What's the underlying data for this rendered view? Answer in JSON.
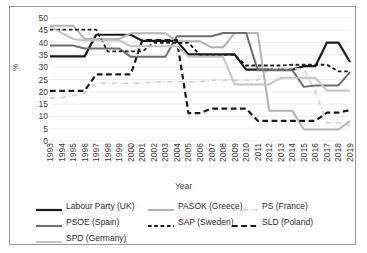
{
  "axes": {
    "ylabel": "%",
    "xlabel": "Year",
    "y_ticks": [
      "0",
      "5",
      "10",
      "15",
      "20",
      "25",
      "30",
      "35",
      "40",
      "45",
      "50"
    ]
  },
  "legend": {
    "rows": [
      [
        {
          "key": "labour_uk",
          "label": "Labour Party (UK)"
        },
        {
          "key": "pasok_greece",
          "label": "PASOK (Greece)"
        },
        {
          "key": "ps_france",
          "label": "PS (France)"
        }
      ],
      [
        {
          "key": "psoe_spain",
          "label": "PSOE (Spain)"
        },
        {
          "key": "sap_sweden",
          "label": "SAP (Sweden)"
        },
        {
          "key": "sld_poland",
          "label": "SLD (Poland)"
        }
      ],
      [
        {
          "key": "spd_germany",
          "label": "SPD (Germany)"
        }
      ]
    ]
  },
  "chart_data": {
    "type": "line",
    "title": "",
    "xlabel": "Year",
    "ylabel": "%",
    "ylim": [
      0,
      50
    ],
    "ytick_step": 5,
    "grid": true,
    "legend_position": "bottom",
    "x": [
      1993,
      1994,
      1995,
      1996,
      1997,
      1998,
      1999,
      2000,
      2001,
      2002,
      2003,
      2004,
      2005,
      2006,
      2007,
      2008,
      2009,
      2010,
      2011,
      2012,
      2013,
      2014,
      2015,
      2016,
      2017,
      2018,
      2019
    ],
    "categories": [
      "1993",
      "1994",
      "1995",
      "1996",
      "1997",
      "1998",
      "1999",
      "2000",
      "2001",
      "2002",
      "2003",
      "2004",
      "2005",
      "2006",
      "2007",
      "2008",
      "2009",
      "2010",
      "2011",
      "2012",
      "2013",
      "2014",
      "2015",
      "2016",
      "2017",
      "2018",
      "2019"
    ],
    "series": [
      {
        "name": "Labour Party (UK)",
        "key": "labour_uk",
        "color": "#1a1a1a",
        "style": "solid",
        "width": 2.2,
        "values": [
          34.4,
          34.4,
          34.4,
          34.4,
          43.2,
          43.2,
          43.2,
          43.2,
          40.7,
          40.7,
          40.7,
          40.7,
          35.2,
          35.2,
          35.2,
          35.2,
          35.2,
          29.0,
          29.0,
          29.0,
          29.0,
          29.0,
          30.4,
          30.4,
          40.0,
          40.0,
          32.1
        ]
      },
      {
        "name": "PASOK (Greece)",
        "key": "pasok_greece",
        "color": "#b3b3b3",
        "style": "solid",
        "width": 2.0,
        "values": [
          46.9,
          46.9,
          46.9,
          41.5,
          41.5,
          41.5,
          41.5,
          43.8,
          43.8,
          43.8,
          43.8,
          40.5,
          40.5,
          40.5,
          38.1,
          38.1,
          43.9,
          43.9,
          43.9,
          12.3,
          12.3,
          12.3,
          4.7,
          4.7,
          4.7,
          4.7,
          8.1
        ]
      },
      {
        "name": "PS (France)",
        "key": "ps_france",
        "color": "#cfcfcf",
        "style": "dashdot",
        "width": 1.6,
        "values": [
          17.6,
          17.6,
          18.5,
          19.5,
          23.5,
          23.5,
          23.5,
          23.5,
          23.5,
          24.1,
          24.1,
          24.1,
          24.1,
          24.1,
          24.7,
          24.7,
          24.7,
          24.7,
          24.7,
          29.4,
          29.4,
          29.4,
          29.4,
          20.0,
          7.4,
          7.4,
          6.2
        ]
      },
      {
        "name": "PSOE (Spain)",
        "key": "psoe_spain",
        "color": "#6e6e6e",
        "style": "solid",
        "width": 2.0,
        "values": [
          38.8,
          38.8,
          38.8,
          37.6,
          37.6,
          37.6,
          37.6,
          34.2,
          34.2,
          34.2,
          34.2,
          42.6,
          42.6,
          42.6,
          42.6,
          43.9,
          43.9,
          43.9,
          28.8,
          28.8,
          28.8,
          28.8,
          22.0,
          22.6,
          22.6,
          22.6,
          28.0
        ]
      },
      {
        "name": "SAP (Sweden)",
        "key": "sap_sweden",
        "color": "#1a1a1a",
        "style": "dashed",
        "width": 1.8,
        "values": [
          45.3,
          45.3,
          45.3,
          45.3,
          45.3,
          36.4,
          36.4,
          36.4,
          36.4,
          39.9,
          39.9,
          39.9,
          39.9,
          35.0,
          35.0,
          35.0,
          35.0,
          30.7,
          30.7,
          30.7,
          30.7,
          31.0,
          31.0,
          31.0,
          31.0,
          28.3,
          28.3
        ]
      },
      {
        "name": "SLD (Poland)",
        "key": "sld_poland",
        "color": "#1a1a1a",
        "style": "longdash",
        "width": 2.2,
        "values": [
          20.4,
          20.4,
          20.4,
          20.4,
          27.1,
          27.1,
          27.1,
          27.1,
          41.0,
          41.0,
          41.0,
          41.0,
          11.3,
          11.3,
          13.2,
          13.2,
          13.2,
          13.2,
          8.2,
          8.2,
          8.2,
          8.2,
          8.2,
          8.2,
          11.5,
          11.5,
          12.6
        ]
      },
      {
        "name": "SPD (Germany)",
        "key": "spd_germany",
        "color": "#c4c4c4",
        "style": "solid",
        "width": 2.0,
        "values": [
          46.5,
          44.0,
          41.5,
          40.9,
          40.9,
          40.9,
          40.9,
          38.5,
          38.5,
          38.5,
          38.5,
          38.5,
          34.2,
          34.2,
          34.2,
          34.2,
          23.0,
          23.0,
          23.0,
          23.0,
          25.7,
          25.7,
          25.7,
          25.7,
          20.5,
          20.5,
          20.5
        ]
      }
    ]
  }
}
